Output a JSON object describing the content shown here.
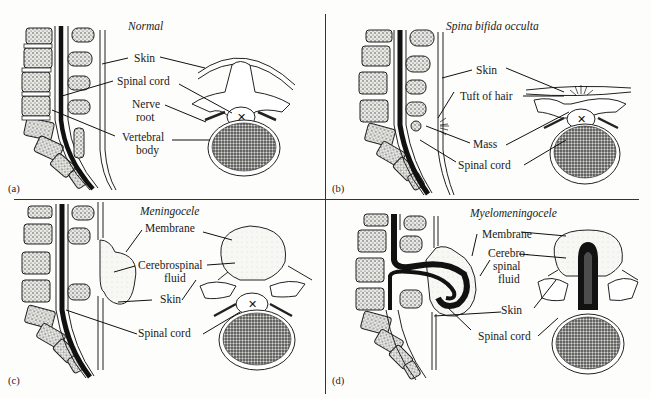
{
  "figure": {
    "panels": [
      {
        "id": "(a)",
        "title": "Normal",
        "labels": {
          "skin": "Skin",
          "spinal_cord": "Spinal cord",
          "nerve_root_1": "Nerve",
          "nerve_root_2": "root",
          "vertebral_body_1": "Vertebral",
          "vertebral_body_2": "body"
        }
      },
      {
        "id": "(b)",
        "title": "Spina bifida occulta",
        "labels": {
          "skin": "Skin",
          "tuft_of_hair": "Tuft of hair",
          "mass": "Mass",
          "spinal_cord": "Spinal cord"
        }
      },
      {
        "id": "(c)",
        "title": "Meningocele",
        "labels": {
          "membrane": "Membrane",
          "csf_1": "Cerebrospinal",
          "csf_2": "fluid",
          "skin": "Skin",
          "spinal_cord": "Spinal cord"
        }
      },
      {
        "id": "(d)",
        "title": "Myelomeningocele",
        "labels": {
          "membrane": "Membrane",
          "csf_1": "Cerebro-",
          "csf_2": "spinal",
          "csf_3": "fluid",
          "skin": "Skin",
          "spinal_cord": "Spinal cord"
        }
      }
    ]
  }
}
